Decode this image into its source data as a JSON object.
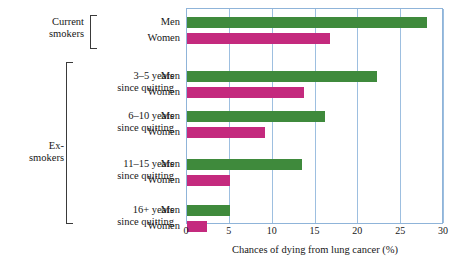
{
  "chart_data": {
    "type": "bar",
    "orientation": "horizontal",
    "title": "",
    "xlabel": "Chances of dying from lung cancer (%)",
    "ylabel": "",
    "xlim": [
      0,
      30
    ],
    "xticks": [
      "0",
      "5",
      "10",
      "15",
      "20",
      "25",
      "30"
    ],
    "grid": true,
    "legend": "none",
    "categories": [
      "Current smokers",
      "3–5 years since quitting",
      "6–10 years since quitting",
      "11–15 years since quitting",
      "16+ years since quitting"
    ],
    "series": [
      {
        "name": "Men",
        "color": "#3f8a3c",
        "values": [
          28.0,
          22.2,
          16.1,
          13.4,
          5.0
        ]
      },
      {
        "name": "Women",
        "color": "#c42a7e",
        "values": [
          16.7,
          13.7,
          9.1,
          5.0,
          2.3
        ]
      }
    ],
    "groups": [
      {
        "super_label": "Current\nsmokers",
        "sub_label": "",
        "bars": [
          {
            "series": "Men",
            "label": "Men",
            "value": 28.0
          },
          {
            "series": "Women",
            "label": "Women",
            "value": 16.7
          }
        ]
      },
      {
        "super_label": "Ex-\nsmokers",
        "sub_label": "3–5 years\nsince quitting",
        "bars": [
          {
            "series": "Men",
            "label": "Men",
            "value": 22.2
          },
          {
            "series": "Women",
            "label": "Women",
            "value": 13.7
          }
        ]
      },
      {
        "super_label": "",
        "sub_label": "6–10 years\nsince quitting",
        "bars": [
          {
            "series": "Men",
            "label": "Men",
            "value": 16.1
          },
          {
            "series": "Women",
            "label": "Women",
            "value": 9.1
          }
        ]
      },
      {
        "super_label": "",
        "sub_label": "11–15 years\nsince quitting",
        "bars": [
          {
            "series": "Men",
            "label": "Men",
            "value": 13.4
          },
          {
            "series": "Women",
            "label": "Women",
            "value": 5.0
          }
        ]
      },
      {
        "super_label": "",
        "sub_label": "16+ years\nsince quitting",
        "bars": [
          {
            "series": "Men",
            "label": "Men",
            "value": 5.0
          },
          {
            "series": "Women",
            "label": "Women",
            "value": 2.3
          }
        ]
      }
    ]
  },
  "labels": {
    "current_smokers": "Current\nsmokers",
    "ex_smokers": "Ex-\nsmokers",
    "g2_sub": "3–5 years\nsince quitting",
    "g3_sub": "6–10 years\nsince quitting",
    "g4_sub": "11–15 years\nsince quitting",
    "g5_sub": "16+ years\nsince quitting",
    "men": "Men",
    "women": "Women",
    "axis_title": "Chances of dying from lung cancer (%)"
  },
  "ticks": {
    "t0": "0",
    "t5": "5",
    "t10": "10",
    "t15": "15",
    "t20": "20",
    "t25": "25",
    "t30": "30"
  },
  "colors": {
    "men": "#3f8a3c",
    "women": "#c42a7e",
    "grid": "#9dbfe0",
    "axis_text": "#171717"
  }
}
